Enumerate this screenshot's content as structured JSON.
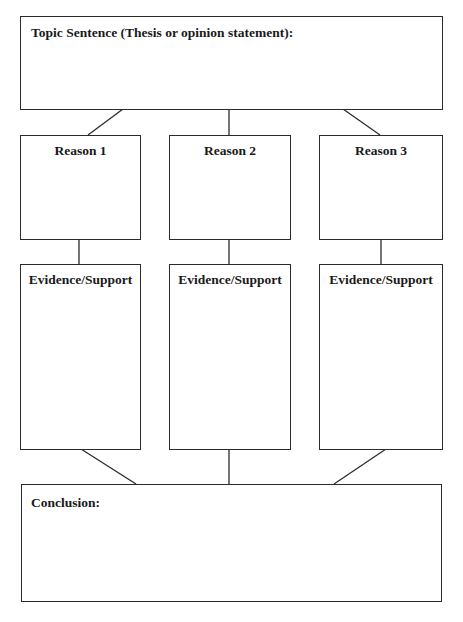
{
  "organizer": {
    "topic": {
      "label": "Topic Sentence (Thesis or opinion statement):",
      "value": ""
    },
    "reasons": [
      {
        "label": "Reason 1",
        "value": ""
      },
      {
        "label": "Reason 2",
        "value": ""
      },
      {
        "label": "Reason 3",
        "value": ""
      }
    ],
    "evidence": [
      {
        "label": "Evidence/Support",
        "value": ""
      },
      {
        "label": "Evidence/Support",
        "value": ""
      },
      {
        "label": "Evidence/Support",
        "value": ""
      }
    ],
    "conclusion": {
      "label": "Conclusion:",
      "value": ""
    }
  },
  "colors": {
    "border": "#2b2b2b",
    "text": "#1a1a1a",
    "background": "#ffffff"
  }
}
